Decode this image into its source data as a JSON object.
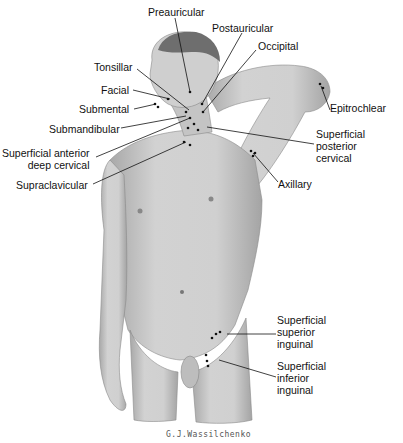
{
  "figure": {
    "signature": "G.J.Wassilchenko",
    "colors": {
      "skin": "#c8c8c8",
      "skin_dark": "#9a9a9a",
      "hair": "#6e6e6e",
      "node": "#111111",
      "leader": "#111111",
      "background": "#ffffff"
    },
    "labels": [
      {
        "id": "preauricular",
        "text": "Preauricular",
        "x": 148,
        "y": 6,
        "align": "left",
        "line": [
          [
            175,
            18
          ],
          [
            190,
            92
          ]
        ]
      },
      {
        "id": "postauricular",
        "text": "Postauricular",
        "x": 212,
        "y": 22,
        "align": "left",
        "line": [
          [
            242,
            33
          ],
          [
            202,
            104
          ]
        ]
      },
      {
        "id": "occipital",
        "text": "Occipital",
        "x": 258,
        "y": 40,
        "align": "left",
        "line": [
          [
            256,
            50
          ],
          [
            203,
            112
          ]
        ]
      },
      {
        "id": "tonsillar",
        "text": "Tonsillar",
        "x": 94,
        "y": 61,
        "align": "left",
        "line": [
          [
            137,
            69
          ],
          [
            189,
            110
          ]
        ]
      },
      {
        "id": "facial",
        "text": "Facial",
        "x": 101,
        "y": 84,
        "align": "left",
        "line": [
          [
            133,
            90
          ],
          [
            170,
            99
          ]
        ]
      },
      {
        "id": "submental",
        "text": "Submental",
        "x": 79,
        "y": 103,
        "align": "left",
        "line": [
          [
            134,
            109
          ],
          [
            156,
            104
          ]
        ]
      },
      {
        "id": "submandibular",
        "text": "Submandibular",
        "x": 49,
        "y": 123,
        "align": "left",
        "line": [
          [
            121,
            128
          ],
          [
            186,
            116
          ]
        ]
      },
      {
        "id": "superficial-anterior-deep-cervical",
        "text": "Superficial anterior\ndeep cervical",
        "x": 2,
        "y": 147,
        "align": "right",
        "line": [
          [
            96,
            157
          ],
          [
            190,
            118
          ]
        ]
      },
      {
        "id": "supraclavicular",
        "text": "Supraclavicular",
        "x": 16,
        "y": 179,
        "align": "left",
        "line": [
          [
            93,
            184
          ],
          [
            186,
            142
          ]
        ]
      },
      {
        "id": "epitrochlear",
        "text": "Epitrochlear",
        "x": 330,
        "y": 102,
        "align": "left",
        "line": [
          [
            330,
            110
          ],
          [
            321,
            86
          ]
        ]
      },
      {
        "id": "superficial-posterior-cervical",
        "text": "Superficial\nposterior\ncervical",
        "x": 316,
        "y": 128,
        "align": "left",
        "line": [
          [
            314,
            144
          ],
          [
            207,
            127
          ]
        ]
      },
      {
        "id": "axillary",
        "text": "Axillary",
        "x": 278,
        "y": 178,
        "align": "left",
        "line": [
          [
            278,
            182
          ],
          [
            253,
            153
          ]
        ]
      },
      {
        "id": "superficial-superior-inguinal",
        "text": "Superficial\nsuperior\ninguinal",
        "x": 277,
        "y": 314,
        "align": "left",
        "line": [
          [
            276,
            334
          ],
          [
            227,
            334
          ]
        ]
      },
      {
        "id": "superficial-inferior-inguinal",
        "text": "Superficial\ninferior\ninguinal",
        "x": 277,
        "y": 360,
        "align": "left",
        "line": [
          [
            276,
            377
          ],
          [
            219,
            360
          ]
        ]
      }
    ]
  }
}
